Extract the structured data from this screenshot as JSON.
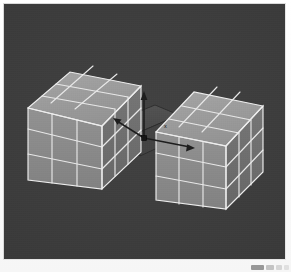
{
  "app": {
    "title": "3D Viewport",
    "viewport_label": "perspective-viewport"
  },
  "viewport": {
    "background_color": "#3a3a3a",
    "border_color": "#d9d9d9",
    "width": 283,
    "height": 257
  },
  "scene": {
    "name": "two-subdivided-cubes",
    "object_count": 2,
    "objects": [
      {
        "id": "cube-left",
        "label": "Cube.001",
        "subdivisions": 3,
        "grid": "3x3x3",
        "wireframe_color": "#e8e8e8",
        "face_colors": {
          "top": "#9d9d9d",
          "front": "#8a8a8a",
          "side": "#6f6f6f"
        },
        "selected": false
      },
      {
        "id": "cube-right",
        "label": "Cube.002",
        "subdivisions": 3,
        "grid": "3x3x3",
        "wireframe_color": "#e8e8e8",
        "face_colors": {
          "top": "#9d9d9d",
          "front": "#8a8a8a",
          "side": "#6f6f6f"
        },
        "selected": false
      },
      {
        "id": "connector-slab",
        "label": "Bridge",
        "wireframe_color": "#2b2b2b",
        "face_colors": {
          "top": "#4f4f4f",
          "front": "#454545",
          "side": "#3d3d3d"
        },
        "selected": true
      }
    ]
  },
  "gizmo": {
    "name": "transform-gizmo",
    "type": "translate",
    "origin_label": "origin",
    "axes": [
      {
        "id": "axis-z",
        "label": "z",
        "color": "#1f1f1f",
        "direction": "up"
      },
      {
        "id": "axis-x",
        "label": "x",
        "color": "#1f1f1f",
        "direction": "right"
      },
      {
        "id": "axis-y",
        "label": "y",
        "color": "#1f1f1f",
        "direction": "depth"
      }
    ]
  },
  "corner_widget": {
    "name": "toolbar-fragment",
    "visible": true
  }
}
